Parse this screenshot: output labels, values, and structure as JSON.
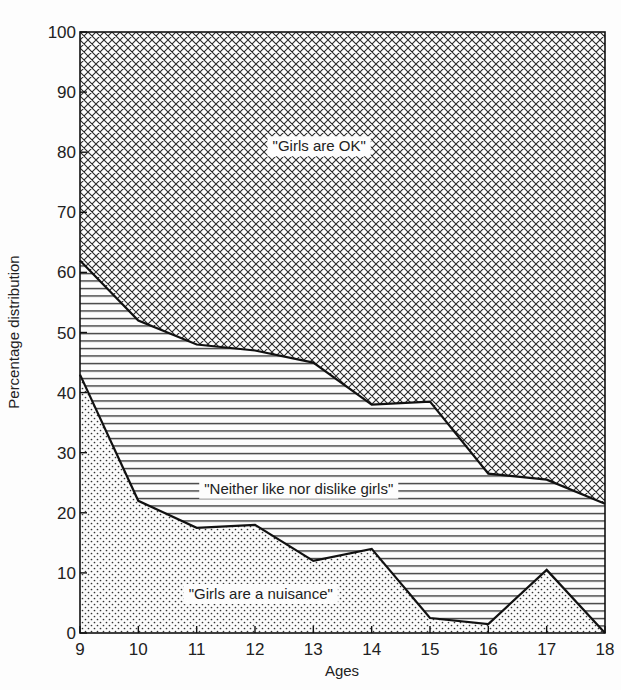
{
  "chart_data": {
    "type": "area",
    "stacked": true,
    "title": "",
    "xlabel": "Ages",
    "ylabel": "Percentage distribution",
    "x": [
      9,
      10,
      11,
      12,
      13,
      14,
      15,
      16,
      17,
      18
    ],
    "xlim": [
      9,
      18
    ],
    "ylim": [
      0,
      100
    ],
    "yticks": [
      0,
      10,
      20,
      30,
      40,
      50,
      60,
      70,
      80,
      90,
      100
    ],
    "xticks": [
      9,
      10,
      11,
      12,
      13,
      14,
      15,
      16,
      17,
      18
    ],
    "grid": false,
    "legend": "inline labels",
    "series": [
      {
        "name": "\"Girls are a nuisance\"",
        "pattern": "dots",
        "values": [
          43,
          22,
          17.5,
          18,
          12,
          14,
          2.5,
          1.5,
          10.5,
          0
        ]
      },
      {
        "name": "\"Neither like nor dislike girls\"",
        "pattern": "horizontal-lines",
        "values": [
          19,
          30,
          30.5,
          29,
          33,
          24,
          36,
          25,
          15,
          21.5
        ]
      },
      {
        "name": "\"Girls are OK\"",
        "pattern": "crosshatch",
        "values": [
          38,
          48,
          52,
          53,
          55,
          62,
          61.5,
          73.5,
          74.5,
          78.5
        ]
      }
    ],
    "cumulative_boundaries": {
      "nuisance_top": [
        43,
        22,
        17.5,
        18,
        12,
        14,
        2.5,
        1.5,
        10.5,
        0
      ],
      "neither_top": [
        62,
        52,
        48,
        47,
        45,
        38,
        38.5,
        26.5,
        25.5,
        21.5
      ]
    },
    "annotations": [
      {
        "text": "\"Girls are OK\"",
        "x": 13.1,
        "y": 81
      },
      {
        "text": "\"Neither like nor dislike girls\"",
        "x": 12.75,
        "y": 24
      },
      {
        "text": "\"Girls are a nuisance\"",
        "x": 12.1,
        "y": 6.5
      }
    ]
  },
  "colors": {
    "ink": "#1a1a1a",
    "paper": "#fdfdfd"
  }
}
